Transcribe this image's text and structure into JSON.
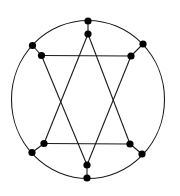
{
  "diagram": {
    "type": "graph",
    "colors": {
      "line": "#1a1a1a",
      "vertex": "#000000",
      "background": "#ffffff"
    },
    "circle": {
      "cx": 88,
      "cy": 99.5,
      "rx": 76.5,
      "ry": 79
    },
    "vertex_radius": 3.6,
    "vertices": [
      {
        "id": "o-top",
        "x": 88,
        "y": 21
      },
      {
        "id": "i-top",
        "x": 88,
        "y": 34
      },
      {
        "id": "o-ul",
        "x": 32.5,
        "y": 45.5
      },
      {
        "id": "i-ul",
        "x": 41.5,
        "y": 55.5
      },
      {
        "id": "o-ur",
        "x": 143,
        "y": 44
      },
      {
        "id": "i-ur",
        "x": 131,
        "y": 56
      },
      {
        "id": "o-ll",
        "x": 32,
        "y": 152.5
      },
      {
        "id": "i-ll",
        "x": 44,
        "y": 143.5
      },
      {
        "id": "o-lr",
        "x": 142,
        "y": 154
      },
      {
        "id": "i-lr",
        "x": 130,
        "y": 144
      },
      {
        "id": "i-bot",
        "x": 87,
        "y": 165
      },
      {
        "id": "o-bot",
        "x": 87,
        "y": 178
      }
    ],
    "edges": [
      [
        "i-top",
        "i-ll"
      ],
      [
        "i-ll",
        "i-lr"
      ],
      [
        "i-lr",
        "i-top"
      ],
      [
        "i-ul",
        "i-ur"
      ],
      [
        "i-ur",
        "i-bot"
      ],
      [
        "i-bot",
        "i-ul"
      ],
      [
        "o-top",
        "i-top"
      ],
      [
        "o-ul",
        "i-ul"
      ],
      [
        "o-ur",
        "i-ur"
      ],
      [
        "o-ll",
        "i-ll"
      ],
      [
        "o-lr",
        "i-lr"
      ],
      [
        "o-bot",
        "i-bot"
      ]
    ]
  }
}
